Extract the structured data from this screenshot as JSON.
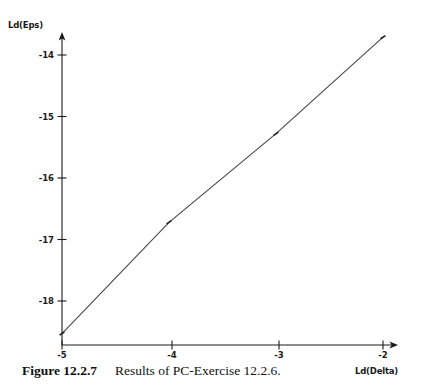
{
  "figure": {
    "caption_label": "Figure 12.2.7",
    "caption_text": "Results of PC-Exercise 12.2.6.",
    "background_color": "#ffffff",
    "ink_color": "#1a1a1a"
  },
  "chart_data": {
    "type": "line",
    "title": "",
    "subtitle": "",
    "xlabel": "Ld(Delta)",
    "ylabel": "Ld(Eps)",
    "xlim": [
      -5.1,
      -1.85
    ],
    "ylim": [
      -18.75,
      -13.45
    ],
    "xticks": [
      -5,
      -4,
      -3,
      -2
    ],
    "yticks": [
      -14,
      -15,
      -16,
      -17,
      -18
    ],
    "xtick_labels": [
      "-5",
      "-4",
      "-3",
      "-2"
    ],
    "ytick_labels": [
      "-14",
      "-15",
      "-16",
      "-17",
      "-18"
    ],
    "grid": false,
    "legend": null,
    "axis_style": "arrow-spine",
    "marker": "tick",
    "line_color": "#444444",
    "x": [
      -5,
      -4,
      -3,
      -2
    ],
    "y": [
      -18.53,
      -16.72,
      -15.28,
      -13.71
    ],
    "series": [
      {
        "name": "Ld(Eps) vs Ld(Delta)",
        "points": [
          {
            "x": -5,
            "y": -18.53
          },
          {
            "x": -4,
            "y": -16.72
          },
          {
            "x": -3,
            "y": -15.28
          },
          {
            "x": -2,
            "y": -13.71
          }
        ]
      }
    ],
    "annotations": []
  }
}
